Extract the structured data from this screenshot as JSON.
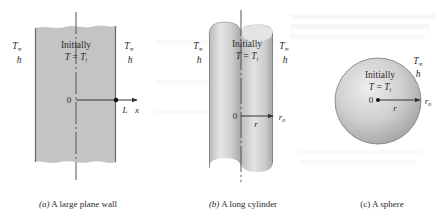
{
  "figure": {
    "panels": [
      {
        "id": "a",
        "shape": "plane-wall",
        "caption_prefix": "(a)",
        "caption_text": " A large plane wall",
        "inside_line1": "Initially",
        "inside_line2_lhs": "T",
        "inside_line2_eq": " = ",
        "inside_line2_rhs": "T",
        "inside_line2_sub": "i",
        "left_T": "T",
        "left_T_sub": "∞",
        "left_h": "h",
        "right_T": "T",
        "right_T_sub": "∞",
        "right_h": "h",
        "origin_label": "0",
        "end_label": "L",
        "axis_label": "x"
      },
      {
        "id": "b",
        "shape": "long-cylinder",
        "caption_prefix": "(b)",
        "caption_text": " A long cylinder",
        "inside_line1": "Initially",
        "inside_line2_lhs": "T",
        "inside_line2_eq": " = ",
        "inside_line2_rhs": "T",
        "inside_line2_sub": "i",
        "left_T": "T",
        "left_T_sub": "∞",
        "left_h": "h",
        "right_T": "T",
        "right_T_sub": "∞",
        "right_h": "h",
        "origin_label": "0",
        "radius_label": "r",
        "outer_label": "r",
        "outer_label_sub": "o"
      },
      {
        "id": "c",
        "shape": "sphere",
        "caption_prefix": "(c)",
        "caption_text": " A sphere",
        "inside_line1": "Initially",
        "inside_line2_lhs": "T",
        "inside_line2_eq": " = ",
        "inside_line2_rhs": "T",
        "inside_line2_sub": "i",
        "right_T": "T",
        "right_T_sub": "∞",
        "right_h": "h",
        "origin_label": "0",
        "radius_label": "r",
        "outer_label": "r",
        "outer_label_sub": "o"
      }
    ],
    "colors": {
      "solid_fill": "#c4c4c4",
      "solid_edge": "#6e6e6e",
      "axis_line": "#555555",
      "text": "#2b2b2b",
      "bleed_text": "#f1f1f1"
    }
  }
}
